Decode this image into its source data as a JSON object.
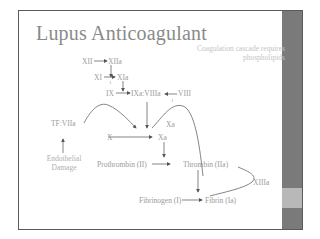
{
  "slide": {
    "title": "Lupus Anticoagulant",
    "note": "Coagulation cascade requires phospholipids",
    "colors": {
      "frame": "#5a5a5a",
      "sidebar": "#7a7a7a",
      "sidebar_accent": "#b8b8b8",
      "title": "#8a8a8a",
      "text": "#9a9a9a",
      "note": "#c4c4c4"
    }
  },
  "diagram": {
    "nodes": {
      "xii": "XII",
      "xiia": "XIIa",
      "xi": "XI",
      "xia": "XIa",
      "ix": "IX",
      "ixa_viiia": "IXa:VIIIa",
      "viii": "VIII",
      "tf_viia": "TF:VIIa",
      "x": "X",
      "xa": "Xa",
      "xa_curve": "Xa",
      "endothelial_damage": "Endothelial Damage",
      "prothrombin": "Prothrombin (II)",
      "thrombin": "Thrombin (IIa)",
      "xiiia": "XIIIa",
      "fibrinogen": "Fibrinogen (I)",
      "fibrin": "Fibrin (Ia)",
      "marker_xi": "1",
      "marker_viii": "1"
    }
  }
}
